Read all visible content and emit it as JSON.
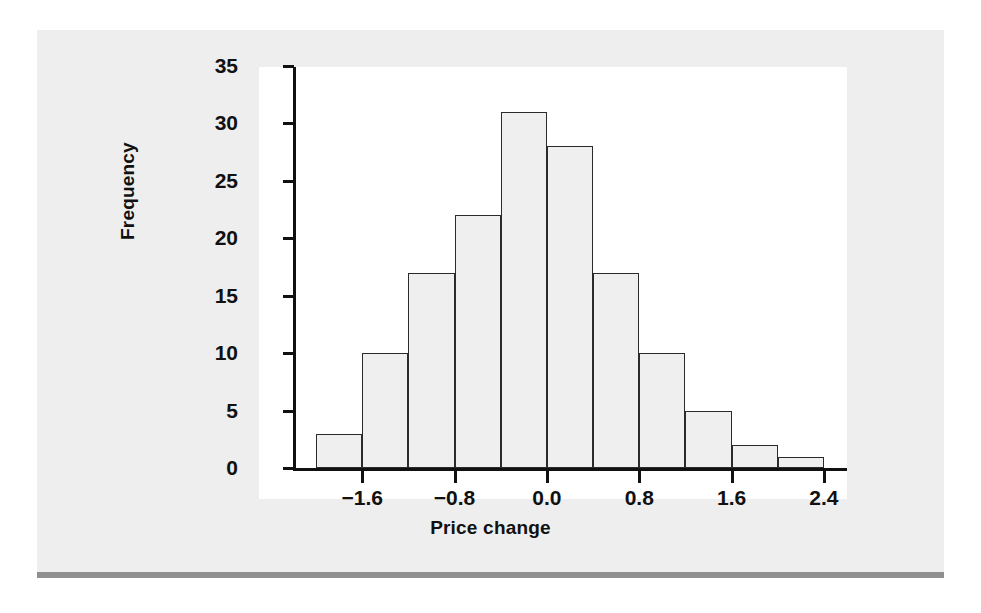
{
  "figure": {
    "panel_bg": "#eeeeee",
    "plot_bg": "#ffffff",
    "rule_color": "#8f8f8f",
    "axis_color": "#111111",
    "bar_fill": "#efefef",
    "bar_stroke": "#2b2b2b"
  },
  "chart_data": {
    "type": "bar",
    "title": "",
    "xlabel": "Price change",
    "ylabel": "Frequency",
    "categories": [
      "-2.0 to -1.6",
      "-1.6 to -1.2",
      "-1.2 to -0.8",
      "-0.8 to -0.4",
      "-0.4 to 0.0",
      "0.0 to 0.4",
      "0.4 to 0.8",
      "0.8 to 1.2",
      "1.2 to 1.6",
      "1.6 to 2.0",
      "2.0 to 2.4"
    ],
    "bin_edges": [
      -2.0,
      -1.6,
      -1.2,
      -0.8,
      -0.4,
      0.0,
      0.4,
      0.8,
      1.2,
      1.6,
      2.0,
      2.4
    ],
    "values": [
      3,
      10,
      17,
      22,
      31,
      28,
      17,
      10,
      5,
      2,
      1
    ],
    "xlim": [
      -2.2,
      2.6
    ],
    "ylim": [
      0,
      35
    ],
    "yticks": [
      0,
      5,
      10,
      15,
      20,
      25,
      30,
      35
    ],
    "ytick_labels": [
      "0",
      "5",
      "10",
      "15",
      "20",
      "25",
      "30",
      "35"
    ],
    "xticks": [
      -1.6,
      -0.8,
      0.0,
      0.8,
      1.6,
      2.4
    ],
    "xtick_labels": [
      "−1.6",
      "−0.8",
      "0.0",
      "0.8",
      "1.6",
      "2.4"
    ],
    "grid": false,
    "legend": null
  }
}
